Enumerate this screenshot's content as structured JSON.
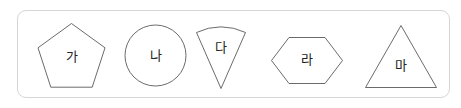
{
  "figure": {
    "panel_border_color": "#d6d6d6",
    "shape_stroke_color": "#5a5a5a",
    "shape_fill_color": "#ffffff",
    "label_color": "#232323",
    "background_color": "#ffffff",
    "shapes": [
      {
        "id": "pentagon",
        "icon": "pentagon-shape-icon",
        "label": "가",
        "points": "71.5,23.5 105,47.8 92.2,87.2 50.8,87.2 38,47.8",
        "label_x": 71.5,
        "label_y": 57
      },
      {
        "id": "circle",
        "icon": "circle-shape-icon",
        "label": "나",
        "cx": 155.5,
        "cy": 55.5,
        "r": 30.5,
        "label_x": 155.5,
        "label_y": 56
      },
      {
        "id": "sector",
        "icon": "circular-sector-shape-icon",
        "label": "다",
        "path": "M 221 88.5 L 196.5 32.5 A 56 56 0 0 1 245.5 32.5 Z",
        "label_x": 221,
        "label_y": 48
      },
      {
        "id": "hexagon",
        "icon": "hexagon-shape-icon",
        "label": "라",
        "points": "289,37.5 325,37.5 342.5,60.5 325,83.5 289,83.5 271.5,60.5",
        "label_x": 307,
        "label_y": 60
      },
      {
        "id": "triangle",
        "icon": "triangle-shape-icon",
        "label": "마",
        "points": "401,25.5 436.5,87.5 365.5,87.5",
        "label_x": 401,
        "label_y": 66
      }
    ]
  }
}
